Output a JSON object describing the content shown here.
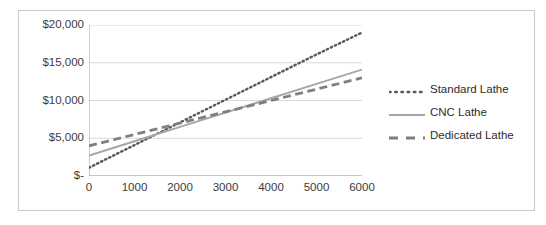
{
  "chart_data": {
    "type": "line",
    "title": "",
    "xlabel": "",
    "ylabel": "",
    "xlim": [
      0,
      6000
    ],
    "ylim": [
      0,
      20000
    ],
    "grid": true,
    "legend_position": "right",
    "x": [
      0,
      1000,
      2000,
      3000,
      4000,
      5000,
      6000
    ],
    "xtick_labels": [
      "0",
      "1000",
      "2000",
      "3000",
      "4000",
      "5000",
      "6000"
    ],
    "ytick_values": [
      0,
      5000,
      10000,
      15000,
      20000
    ],
    "ytick_labels": [
      "$-",
      "$5,000",
      "$10,000",
      "$15,000",
      "$20,000"
    ],
    "series": [
      {
        "name": "Standard Lathe",
        "style": "dotted",
        "color": "#595959",
        "values": [
          1100,
          4100,
          7100,
          10100,
          13100,
          16100,
          19000
        ]
      },
      {
        "name": "CNC Lathe",
        "style": "solid",
        "color": "#a6a6a6",
        "values": [
          2700,
          4600,
          6500,
          8400,
          10300,
          12200,
          14100
        ]
      },
      {
        "name": "Dedicated Lathe",
        "style": "dashed",
        "color": "#7f7f7f",
        "values": [
          4000,
          5500,
          7000,
          8500,
          10000,
          11500,
          13000
        ]
      }
    ]
  },
  "legend": {
    "items": [
      {
        "label": "Standard Lathe",
        "marker": "dotted-line-swatch"
      },
      {
        "label": "CNC Lathe",
        "marker": "solid-line-swatch"
      },
      {
        "label": "Dedicated Lathe",
        "marker": "dashed-line-swatch"
      }
    ]
  },
  "colors": {
    "frame": "#c9c9c9",
    "grid": "#d9d9d9",
    "axis": "#a0a0a0",
    "text": "#3b3b3b",
    "background": "#ffffff"
  }
}
